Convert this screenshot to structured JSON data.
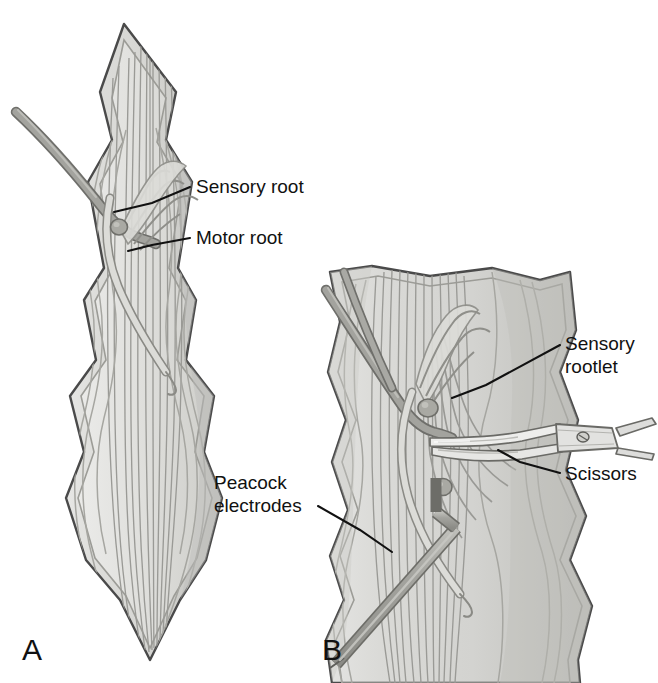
{
  "figure": {
    "kind": "anatomical-illustration",
    "background_color": "#ffffff",
    "ink_color": "#111111"
  },
  "palette": {
    "outline": "#4a4a4a",
    "outline_dark": "#3a3a3a",
    "cord_fill_light": "#e2e2e0",
    "cord_fill_mid": "#d2d2cf",
    "cord_fill_shadow": "#bdbdba",
    "fiber_line": "#9a9a96",
    "fiber_line_dark": "#7e7e7a",
    "root_fill": "#c9c9c4",
    "root_outline": "#8a8a85",
    "nerve_dark": "#9b9b96",
    "nerve_dark_outline": "#6f6f6b",
    "ganglion_fill": "#a9a9a3",
    "ganglion_outline": "#6f6f6a",
    "electrode_fill": "#a6a6a1",
    "electrode_outline": "#6d6d68",
    "instrument_fill": "#e6e6e4",
    "instrument_outline": "#6a6a66",
    "instrument_shadow": "#bcbcb8"
  },
  "panels": [
    {
      "id": "A",
      "letter": "A",
      "name": "panel-a-intact-nerve-roots",
      "labels": [
        {
          "id": "sensory-root",
          "text": "Sensory root",
          "text_x": 196,
          "text_y": 193,
          "leader": "M 190 187 L 152 203 L 114 212"
        },
        {
          "id": "motor-root",
          "text": "Motor root",
          "text_x": 196,
          "text_y": 244,
          "leader": "M 190 238 L 152 245 L 128 251"
        }
      ]
    },
    {
      "id": "B",
      "letter": "B",
      "name": "panel-b-rootlet-section-with-instruments",
      "labels": [
        {
          "id": "sensory-rootlet",
          "text_line1": "Sensory",
          "text_line2": "rootlet",
          "text_x": 565,
          "text_y": 350,
          "text_y2": 373,
          "leader": "M 560 345 L 486 385 L 452 398"
        },
        {
          "id": "scissors",
          "text": "Scissors",
          "text_x": 565,
          "text_y": 480,
          "leader": "M 560 473 L 520 462 L 498 450"
        },
        {
          "id": "peacock-electrodes",
          "text_line1": "Peacock",
          "text_line2": "electrodes",
          "text_x": 214,
          "text_y": 489,
          "text_y2": 512,
          "leader": "M 318 506 L 360 530 L 392 552"
        }
      ]
    }
  ],
  "panel_letters": [
    {
      "id": "A",
      "text": "A",
      "x": 22,
      "y": 660
    },
    {
      "id": "B",
      "text": "B",
      "x": 322,
      "y": 660
    }
  ],
  "anatomy": {
    "structures": [
      "spinal cord dorsal surface",
      "sensory (dorsal) root",
      "motor (ventral) root",
      "sensory rootlets",
      "dorsal root ganglion",
      "longitudinal nerve fiber tracts"
    ],
    "instruments": [
      "Peacock electrodes",
      "Scissors"
    ]
  }
}
